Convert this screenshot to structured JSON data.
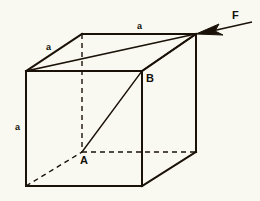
{
  "figure": {
    "type": "cube-force-diagram",
    "background_color": "#faf9f1",
    "line_color": "#1a1208",
    "width": 260,
    "height": 201
  },
  "labels": {
    "edge_top_back": "a",
    "edge_top_left_diagonal": "a",
    "edge_vertical_left": "a",
    "point_a": "A",
    "point_b": "B",
    "force": "F"
  },
  "geometry": {
    "front_face": {
      "top_left": [
        26,
        71
      ],
      "top_right": [
        142,
        71
      ],
      "bottom_right": [
        142,
        186
      ],
      "bottom_left": [
        26,
        186
      ]
    },
    "back_face": {
      "top_left": [
        82,
        34
      ],
      "top_right": [
        196,
        34
      ],
      "bottom_right": [
        196,
        152
      ],
      "bottom_left": [
        82,
        152
      ]
    },
    "hidden_edges": [
      "back_top_left -> back_bottom_left (vertical dashed)",
      "back_bottom_left -> back_bottom_right (horizontal dashed)",
      "front_bottom_left -> back_bottom_left (dashed receding)"
    ],
    "diagonals": [
      "front_top_left -> back_top_right",
      "back_bottom_left(A) -> front_top_right(B) -> back_top_right"
    ],
    "force_arrow": {
      "tail": [
        252,
        24
      ],
      "tip": [
        196,
        34
      ],
      "points_at": "back_top_right_corner"
    }
  }
}
